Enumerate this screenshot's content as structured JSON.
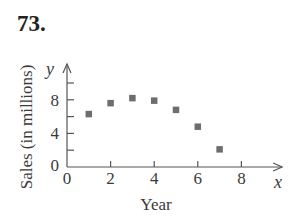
{
  "problem_number": "73.",
  "chart_data": {
    "type": "scatter",
    "title": "",
    "xlabel": "Year",
    "ylabel": "Sales (in millions)",
    "x_axis_var": "x",
    "y_axis_var": "y",
    "x_ticks": [
      0,
      2,
      4,
      6,
      8
    ],
    "y_ticks": [
      0,
      4,
      8
    ],
    "y_minor_ticks": [
      2,
      6,
      10
    ],
    "xlim": [
      0,
      9.5
    ],
    "ylim": [
      0,
      12.5
    ],
    "grid": false,
    "legend": null,
    "marker": "square",
    "marker_color": "#6d6d6d",
    "x": [
      1,
      2,
      3,
      4,
      5,
      6,
      7
    ],
    "y": [
      6.3,
      7.6,
      8.2,
      7.9,
      6.8,
      4.8,
      2.1
    ]
  }
}
